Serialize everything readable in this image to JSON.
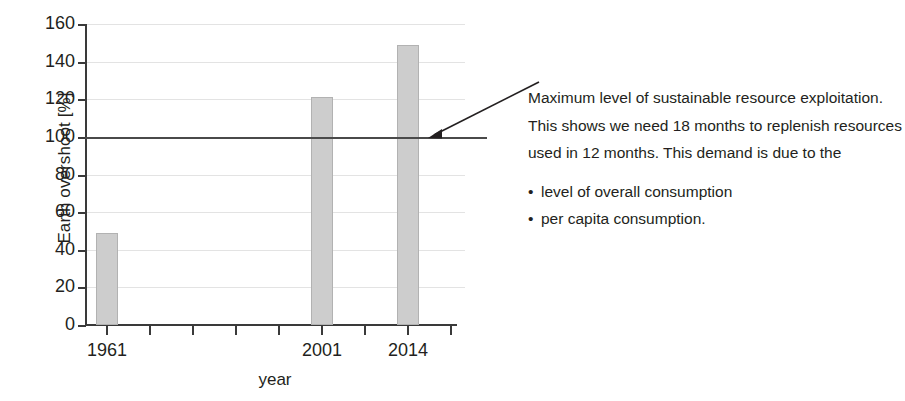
{
  "chart_data": {
    "type": "bar",
    "title": "",
    "xlabel": "year",
    "ylabel": "Earth overshoot [%]",
    "categories": [
      "1961",
      "2001",
      "2014"
    ],
    "values": [
      49,
      121,
      149
    ],
    "ylim": [
      0,
      160
    ],
    "yticks": [
      0,
      20,
      40,
      60,
      80,
      100,
      120,
      140,
      160
    ],
    "ytick_labels": [
      "0",
      "20",
      "40",
      "60",
      "80",
      "100",
      "120",
      "140",
      "160"
    ],
    "grid": true,
    "legend": "none",
    "series": [
      {
        "name": "Earth overshoot",
        "values": [
          49,
          121,
          149
        ]
      }
    ],
    "reference_line": {
      "value": 100,
      "label": "Maximum level of sustainable resource exploitation"
    },
    "bar_color": "#cdcdcd",
    "bar_edge_color": "#b2b2b2",
    "axis_color": "#3a3a3a",
    "grid_color": "#e3e3e3",
    "reference_line_color": "#4a4a4a",
    "x_slots": 9,
    "x_slot_indices": [
      0,
      5,
      7
    ]
  },
  "annotation": {
    "paragraph": "Maximum level of sustainable resource exploitation. This shows we need 18 months to replenish resources used in 12 months. This demand is due to the",
    "bullets": [
      "level of overall consumption",
      "per capita consumption."
    ]
  }
}
